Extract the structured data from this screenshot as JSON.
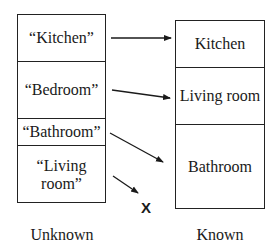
{
  "diagram": {
    "unknown_column": {
      "label": "Unknown",
      "items": [
        "“Kitchen”",
        "“Bedroom”",
        "“Bathroom”",
        "“Living room”"
      ]
    },
    "known_column": {
      "label": "Known",
      "items": [
        "Kitchen",
        "Living room",
        "Bathroom"
      ]
    },
    "mappings": [
      {
        "from": "“Kitchen”",
        "to": "Kitchen"
      },
      {
        "from": "“Bedroom”",
        "to": "Living room"
      },
      {
        "from": "“Bathroom”",
        "to": "Bathroom"
      },
      {
        "from": "“Living room”",
        "to": "X"
      }
    ],
    "no_match_symbol": "X"
  }
}
